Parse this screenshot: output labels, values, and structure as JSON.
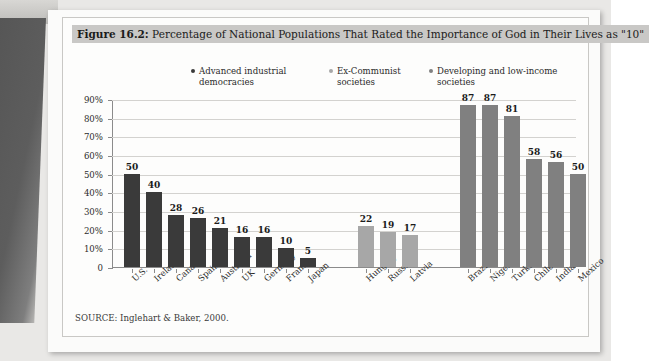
{
  "figure": {
    "number_label": "Figure 16.2:",
    "title": "Percentage of National Populations That Rated the Importance of God in Their Lives as \"10\"",
    "source": "SOURCE: Inglehart & Baker, 2000."
  },
  "legend": [
    {
      "label": "Advanced industrial democracies",
      "color": "#3a3a3a"
    },
    {
      "label": "Ex-Communist societies",
      "color": "#a7a7a7"
    },
    {
      "label": "Developing and low-income societies",
      "color": "#808080"
    }
  ],
  "chart_data": {
    "type": "bar",
    "title": "Percentage of National Populations That Rated the Importance of God in Their Lives as \"10\"",
    "xlabel": "",
    "ylabel": "",
    "ylim": [
      0,
      90
    ],
    "grid": true,
    "legend_position": "top",
    "ytick_labels": [
      "90%",
      "80%",
      "70%",
      "60%",
      "50%",
      "40%",
      "30%",
      "20%",
      "10%",
      "0"
    ],
    "ytick_values": [
      90,
      80,
      70,
      60,
      50,
      40,
      30,
      20,
      10,
      0
    ],
    "groups": [
      {
        "name": "Advanced industrial democracies",
        "color": "#3a3a3a",
        "categories": [
          "U.S.",
          "Ireland",
          "Canada",
          "Spain",
          "Australia",
          "UK",
          "Germany",
          "France",
          "Japan"
        ],
        "values": [
          50,
          40,
          28,
          26,
          21,
          16,
          16,
          10,
          5
        ]
      },
      {
        "name": "Ex-Communist societies",
        "color": "#a7a7a7",
        "categories": [
          "Hungary",
          "Russia",
          "Latvia"
        ],
        "values": [
          22,
          19,
          17
        ]
      },
      {
        "name": "Developing and low-income societies",
        "color": "#808080",
        "categories": [
          "Brazil",
          "Nigeria",
          "Turkey",
          "Chile",
          "India",
          "Mexico"
        ],
        "values": [
          87,
          87,
          81,
          58,
          56,
          50
        ]
      }
    ]
  }
}
